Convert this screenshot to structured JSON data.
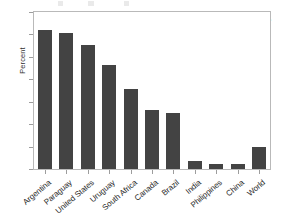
{
  "chart_data": {
    "type": "bar",
    "title": "",
    "subtitle": "",
    "xlabel": "",
    "ylabel": "Percent",
    "ylim": [
      0,
      70
    ],
    "yticks": [
      0,
      10,
      20,
      30,
      40,
      50,
      60,
      70
    ],
    "ytick_labels": [
      "0",
      "10",
      "20",
      "30",
      "40",
      "50",
      "60",
      "70"
    ],
    "grid": false,
    "legend": null,
    "categories": [
      "Argentina",
      "Paraguay",
      "United States",
      "Uruguay",
      "South Africa",
      "Canada",
      "Brazil",
      "India",
      "Philippines",
      "China",
      "World"
    ],
    "values": [
      62,
      60.5,
      55.5,
      46.5,
      35.5,
      26.5,
      25,
      3.5,
      2.3,
      2.3,
      10
    ],
    "annotations": [
      {
        "name": "source-note",
        "text": "Source: James, FAO",
        "position": "top-right",
        "style": "italic"
      }
    ],
    "bar_color": "#434343",
    "background_color": "#ffffff",
    "frame_color": "#b9b9b9"
  }
}
